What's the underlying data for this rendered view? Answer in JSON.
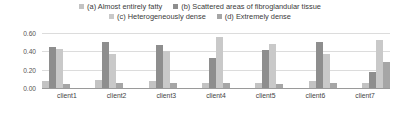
{
  "chart_data": {
    "type": "bar",
    "title": "",
    "xlabel": "",
    "ylabel": "",
    "ylim": [
      0.0,
      0.6
    ],
    "yticks": [
      "0.00",
      "0.20",
      "0.40",
      "0.60"
    ],
    "ytick_values": [
      0.0,
      0.2,
      0.4,
      0.6
    ],
    "grid": true,
    "legend_position": "top-center",
    "categories": [
      "client1",
      "client2",
      "client3",
      "client4",
      "client5",
      "client6",
      "client7"
    ],
    "series": [
      {
        "name": "(a) Almost entirely fatty",
        "color": "#c3c3c3",
        "values": [
          0.08,
          0.09,
          0.08,
          0.06,
          0.06,
          0.08,
          0.05
        ]
      },
      {
        "name": "(b) Scattered areas of fibroglandular tissue",
        "color": "#8e8e8e",
        "values": [
          0.45,
          0.5,
          0.47,
          0.33,
          0.42,
          0.5,
          0.18
        ]
      },
      {
        "name": "(c) Heterogeneously dense",
        "color": "#c9c9c9",
        "values": [
          0.43,
          0.37,
          0.4,
          0.56,
          0.48,
          0.37,
          0.52
        ]
      },
      {
        "name": "(d) Extremely dense",
        "color": "#a6a6a6",
        "values": [
          0.04,
          0.05,
          0.06,
          0.05,
          0.04,
          0.05,
          0.28
        ]
      }
    ]
  },
  "legend": {
    "rows": [
      [
        {
          "label": "(a) Almost entirely fatty",
          "color": "#c3c3c3"
        },
        {
          "label": "(b) Scattered areas of fibroglandular tissue",
          "color": "#8e8e8e"
        }
      ],
      [
        {
          "label": "(c) Heterogeneously dense",
          "color": "#c9c9c9"
        },
        {
          "label": "(d) Extremely dense",
          "color": "#a6a6a6"
        }
      ]
    ]
  }
}
